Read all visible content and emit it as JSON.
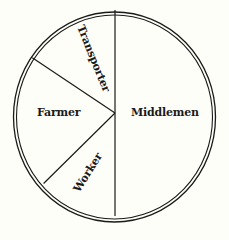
{
  "chart_data": {
    "type": "pie",
    "title": "",
    "categories": [
      "Middlemen",
      "Worker",
      "Farmer",
      "Transporter"
    ],
    "values": [
      50,
      13,
      21,
      16
    ],
    "unit": "percent (estimated from slice angles)",
    "start_angle_deg": 0,
    "direction": "clockwise",
    "legend": "none (labels inside slices)",
    "colors": {
      "fill": "#fefef8",
      "stroke": "#1a1a1a"
    }
  },
  "labels": {
    "middlemen": "Middlemen",
    "worker": "Worker",
    "farmer": "Farmer",
    "transporter": "Transporter"
  }
}
